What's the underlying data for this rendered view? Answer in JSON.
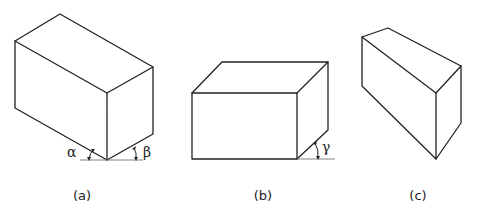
{
  "figure": {
    "panels": [
      {
        "id": "a",
        "label": "(a)",
        "angles": [
          "α",
          "β"
        ],
        "description": "Isometric-style box resting on a bottom vertex with two base angles"
      },
      {
        "id": "b",
        "label": "(b)",
        "angles": [
          "γ"
        ],
        "description": "Oblique box with front face parallel to the picture plane and one receding angle"
      },
      {
        "id": "c",
        "label": "(c)",
        "angles": [],
        "description": "Box viewed from a general orientation without angle annotations"
      }
    ],
    "colors": {
      "line": "#222222",
      "baseline": "#777777",
      "background": "#ffffff"
    }
  }
}
